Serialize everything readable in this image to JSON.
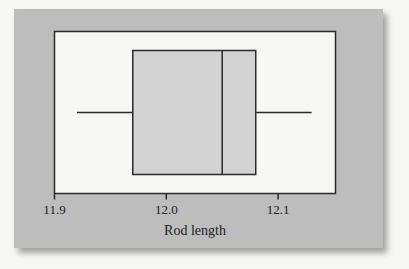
{
  "chart_data": {
    "type": "boxplot",
    "title": "",
    "xlabel": "Rod length",
    "ylabel": "",
    "xlim": [
      11.9,
      12.15
    ],
    "ticks": [
      {
        "value": 11.9,
        "label": "11.9"
      },
      {
        "value": 12.0,
        "label": "12.0"
      },
      {
        "value": 12.1,
        "label": "12.1"
      }
    ],
    "orientation": "horizontal",
    "grid": false,
    "legend": null,
    "boxes": [
      {
        "min": 11.92,
        "q1": 11.97,
        "median": 12.05,
        "q3": 12.08,
        "max": 12.13
      }
    ]
  },
  "colors": {
    "panel": "#bdbdbd",
    "plot_area": "#f7f7f5",
    "box_fill": "#d3d3d3",
    "line": "#2a2a2a"
  }
}
